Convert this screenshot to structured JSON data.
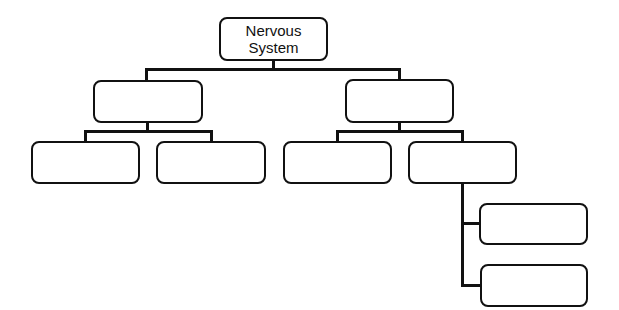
{
  "diagram": {
    "title": "Nervous System",
    "root": {
      "label_line1": "Nervous",
      "label_line2": "System"
    },
    "level2": [
      {
        "label": ""
      },
      {
        "label": ""
      }
    ],
    "level3": [
      {
        "label": ""
      },
      {
        "label": ""
      },
      {
        "label": ""
      },
      {
        "label": ""
      }
    ],
    "level4": [
      {
        "label": ""
      },
      {
        "label": ""
      }
    ],
    "colors": {
      "stroke": "#111111",
      "background": "#ffffff"
    }
  }
}
